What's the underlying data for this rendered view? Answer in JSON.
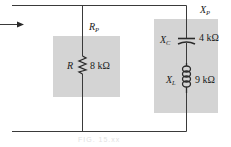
{
  "figure": {
    "colors": {
      "wire": "#3a3a3a",
      "shade": "#d4d4d4",
      "text": "#1a1a1a"
    },
    "arrow": {
      "direction": "right"
    },
    "branches": [
      {
        "group_label": "R",
        "group_label_sub": "P",
        "component": "resistor",
        "symbol": "R",
        "symbol_sub": "",
        "value": "8 kΩ"
      },
      {
        "group_label": "X",
        "group_label_sub": "P",
        "components": [
          {
            "component": "capacitor",
            "symbol": "X",
            "symbol_sub": "C",
            "value": "4 kΩ"
          },
          {
            "component": "inductor",
            "symbol": "X",
            "symbol_sub": "L",
            "value": "9 kΩ"
          }
        ]
      }
    ],
    "caption": "FIG. 15.xx"
  }
}
